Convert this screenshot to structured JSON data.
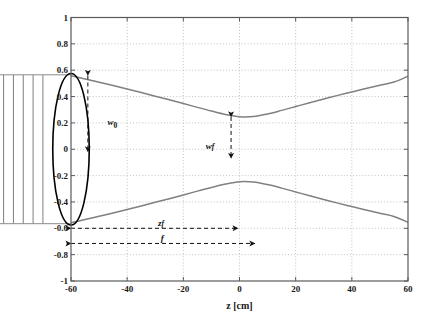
{
  "figure": {
    "type": "technical-plot",
    "background_color": "#ffffff",
    "axes_color": "#555555",
    "grid_color": "#b0b0b0",
    "beam_color": "#808080",
    "lens_color": "#000000",
    "annotation_color": "#111111"
  },
  "chart_data": {
    "type": "line",
    "title": "",
    "subtitle": "",
    "xlabel": "z [cm]",
    "ylabel": "",
    "xlim": [
      -60,
      60
    ],
    "ylim": [
      -1,
      1
    ],
    "xticks": [
      -60,
      -40,
      -20,
      0,
      20,
      40,
      60
    ],
    "xtick_labels": [
      "-60",
      "-40",
      "-20",
      "0",
      "20",
      "40",
      "60"
    ],
    "yticks": [
      1,
      0.8,
      0.6,
      0.4,
      0.2,
      0,
      -0.2,
      -0.4,
      -0.6,
      -0.8,
      -1
    ],
    "ytick_labels": [
      "1",
      "0.8",
      "0.6",
      "0.4",
      "0.2",
      "0",
      "-0.2",
      "-0.4",
      "-0.6",
      "-0.8",
      "-1"
    ],
    "grid": true,
    "grid_style": "dotted",
    "legend": null,
    "legend_position": "none",
    "series": [
      {
        "name": "beam-envelope-upper",
        "color": "#808080",
        "x": [
          -60,
          -55,
          -50,
          -45,
          -40,
          -35,
          -30,
          -25,
          -20,
          -15,
          -10,
          -5,
          0,
          5,
          10,
          15,
          20,
          25,
          30,
          35,
          40,
          45,
          50,
          55,
          60
        ],
        "values": [
          0.558,
          0.534,
          0.509,
          0.484,
          0.458,
          0.431,
          0.403,
          0.375,
          0.347,
          0.318,
          0.29,
          0.264,
          0.246,
          0.248,
          0.268,
          0.295,
          0.324,
          0.353,
          0.381,
          0.409,
          0.435,
          0.461,
          0.486,
          0.51,
          0.555
        ]
      },
      {
        "name": "beam-envelope-lower",
        "color": "#808080",
        "x": [
          -60,
          -55,
          -50,
          -45,
          -40,
          -35,
          -30,
          -25,
          -20,
          -15,
          -10,
          -5,
          0,
          5,
          10,
          15,
          20,
          25,
          30,
          35,
          40,
          45,
          50,
          55,
          60
        ],
        "values": [
          -0.558,
          -0.534,
          -0.509,
          -0.484,
          -0.458,
          -0.431,
          -0.403,
          -0.375,
          -0.347,
          -0.318,
          -0.29,
          -0.264,
          -0.246,
          -0.248,
          -0.268,
          -0.295,
          -0.324,
          -0.353,
          -0.381,
          -0.409,
          -0.435,
          -0.461,
          -0.486,
          -0.51,
          -0.555
        ]
      }
    ],
    "annotations": [
      {
        "name": "w0",
        "label_html": "w<sub>0</sub>",
        "label_text": "w0",
        "kind": "double-arrow-vertical",
        "x": -54,
        "y_from": 0.56,
        "y_to": -0.02,
        "label_x": -47,
        "label_y": 0.235,
        "style": "dashed"
      },
      {
        "name": "wf",
        "label_html": "w<span class=\"subi\">f</span>",
        "label_text": "wf",
        "kind": "double-arrow-vertical",
        "x": -3,
        "y_from": 0.245,
        "y_to": -0.07,
        "label_x": -12,
        "label_y": 0.055,
        "style": "dashed"
      },
      {
        "name": "zf",
        "label_html": "z<span class=\"subi\">f</span>",
        "label_text": "zf",
        "kind": "double-arrow-horizontal",
        "y": -0.6,
        "x_from": -60,
        "x_to": -0.5,
        "label_x": -29,
        "label_y": -0.53,
        "style": "dashed"
      },
      {
        "name": "f",
        "label_html": "f",
        "label_text": "f",
        "kind": "double-arrow-horizontal",
        "y": -0.715,
        "x_from": -60,
        "x_to": 5.5,
        "label_x": -28,
        "label_y": -0.645,
        "style": "dashed"
      }
    ],
    "shapes": [
      {
        "name": "lens",
        "kind": "ellipse",
        "cx": -60,
        "cy": 0,
        "rx": 6.5,
        "ry": 0.575,
        "stroke": "#000000",
        "stroke_width": 1.6,
        "fill": "none"
      },
      {
        "name": "incoming-plane-wavefronts",
        "kind": "vertical-lines",
        "count": 7,
        "x_values": [
          -91,
          -87.5,
          -84,
          -80.5,
          -77,
          -73.5,
          -70
        ],
        "y_from": 0.565,
        "y_to": -0.565,
        "stroke": "#6f6f6f",
        "stroke_width": 0.9
      },
      {
        "name": "incoming-beam-top-rail",
        "kind": "horizontal-line",
        "y": 0.565,
        "x_from": -93,
        "x_to": -60,
        "stroke": "#8a8a8a"
      },
      {
        "name": "incoming-beam-bottom-rail",
        "kind": "horizontal-line",
        "y": -0.565,
        "x_from": -93,
        "x_to": -60,
        "stroke": "#8a8a8a"
      }
    ]
  }
}
